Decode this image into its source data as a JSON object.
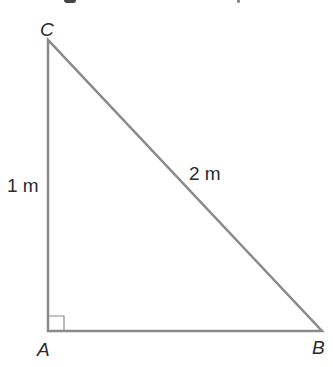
{
  "diagram": {
    "type": "right-triangle",
    "stroke_color": "#8a8a8a",
    "vertices": {
      "A": {
        "label": "A",
        "x": 48,
        "y": 331
      },
      "B": {
        "label": "B",
        "x": 322,
        "y": 331
      },
      "C": {
        "label": "C",
        "x": 48,
        "y": 40
      }
    },
    "sides": {
      "AC": {
        "label": "1 m"
      },
      "BC": {
        "label": "2 m"
      }
    },
    "right_angle_at": "A"
  }
}
